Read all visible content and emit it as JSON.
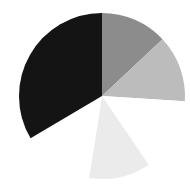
{
  "chart_data": {
    "type": "pie",
    "title": "",
    "legend": [],
    "labels_visible": false,
    "start_angle_deg": 0,
    "direction": "clockwise",
    "center": [
      102,
      96
    ],
    "radius": 83,
    "slices": [
      {
        "name": "slice-1",
        "value": 13,
        "color": "#8c8c8c"
      },
      {
        "name": "slice-2",
        "value": 13,
        "color": "#bcbcbc"
      },
      {
        "name": "slice-3",
        "value": 14.5,
        "color": "#ffffff"
      },
      {
        "name": "slice-4",
        "value": 12,
        "color": "#ebebeb"
      },
      {
        "name": "slice-5",
        "value": 14,
        "color": "#ffffff"
      },
      {
        "name": "slice-6",
        "value": 33.5,
        "color": "#141414"
      }
    ]
  }
}
